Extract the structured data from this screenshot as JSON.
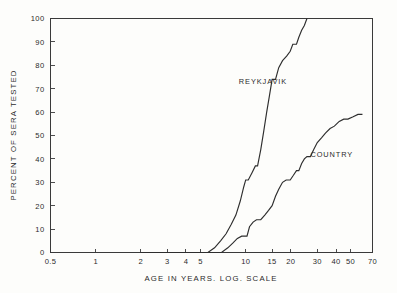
{
  "figure": {
    "background_color": "#fdfdfb",
    "line_color": "#2e2e2e",
    "axis_color": "#3a3a3a"
  },
  "chart_data": {
    "type": "line",
    "title": "",
    "subtitle": "",
    "xlabel": "AGE IN YEARS. LOG. SCALE",
    "ylabel": "PERCENT OF SERA TESTED",
    "xscale": "log",
    "yscale": "linear",
    "xlim": [
      0.5,
      70
    ],
    "ylim": [
      0,
      100
    ],
    "grid": false,
    "legend_position": "inline-annotation",
    "x_ticks": [
      0.5,
      1,
      2,
      3,
      4,
      5,
      10,
      15,
      20,
      30,
      40,
      50,
      70
    ],
    "x_tick_labels": [
      "0.5",
      "1",
      "2",
      "3",
      "4",
      "5",
      "10",
      "15",
      "20",
      "30",
      "40",
      "50",
      "70"
    ],
    "y_ticks": [
      0,
      10,
      20,
      30,
      40,
      50,
      60,
      70,
      80,
      90,
      100
    ],
    "y_tick_labels": [
      "0",
      "10",
      "20",
      "30",
      "40",
      "50",
      "60",
      "70",
      "80",
      "90",
      "100"
    ],
    "annotations": [
      {
        "text": "REYKJAVIK",
        "x": 9.0,
        "y": 72
      },
      {
        "text": "COUNTRY",
        "x": 27.0,
        "y": 41
      }
    ],
    "series": [
      {
        "name": "REYKJAVIK",
        "label": "REYKJAVIK",
        "points": [
          [
            2.0,
            0
          ],
          [
            3.0,
            0
          ],
          [
            4.0,
            0
          ],
          [
            5.0,
            0
          ],
          [
            5.6,
            0
          ],
          [
            6.2,
            2
          ],
          [
            6.8,
            5
          ],
          [
            7.4,
            8
          ],
          [
            8.0,
            12
          ],
          [
            8.6,
            16
          ],
          [
            9.2,
            22
          ],
          [
            9.7,
            28
          ],
          [
            10.0,
            31
          ],
          [
            10.4,
            31
          ],
          [
            11.0,
            34
          ],
          [
            11.6,
            37
          ],
          [
            12.0,
            37
          ],
          [
            12.6,
            44
          ],
          [
            13.2,
            52
          ],
          [
            13.8,
            60
          ],
          [
            14.4,
            67
          ],
          [
            15.0,
            74
          ],
          [
            15.8,
            74
          ],
          [
            16.6,
            79
          ],
          [
            17.6,
            82
          ],
          [
            18.8,
            84
          ],
          [
            19.8,
            86
          ],
          [
            20.6,
            89
          ],
          [
            21.8,
            89
          ],
          [
            22.6,
            92
          ],
          [
            23.6,
            95
          ],
          [
            24.6,
            97
          ],
          [
            25.6,
            100
          ]
        ]
      },
      {
        "name": "COUNTRY",
        "label": "COUNTRY",
        "points": [
          [
            2.0,
            0
          ],
          [
            3.0,
            0
          ],
          [
            4.0,
            0
          ],
          [
            5.0,
            0
          ],
          [
            6.0,
            0
          ],
          [
            6.9,
            0
          ],
          [
            7.6,
            2
          ],
          [
            8.2,
            4
          ],
          [
            8.8,
            6
          ],
          [
            9.4,
            7
          ],
          [
            10.2,
            7
          ],
          [
            10.6,
            11
          ],
          [
            11.2,
            13
          ],
          [
            11.8,
            14
          ],
          [
            12.6,
            14
          ],
          [
            13.4,
            16
          ],
          [
            14.2,
            18
          ],
          [
            15.0,
            20
          ],
          [
            15.8,
            24
          ],
          [
            16.6,
            27
          ],
          [
            17.6,
            30
          ],
          [
            18.6,
            31
          ],
          [
            19.8,
            31
          ],
          [
            20.8,
            33
          ],
          [
            21.8,
            35
          ],
          [
            22.6,
            35
          ],
          [
            23.6,
            38
          ],
          [
            24.6,
            40
          ],
          [
            25.6,
            41
          ],
          [
            27.0,
            41
          ],
          [
            28.4,
            44
          ],
          [
            30.0,
            47
          ],
          [
            32.0,
            49
          ],
          [
            34.0,
            51
          ],
          [
            36.5,
            53
          ],
          [
            39.0,
            54
          ],
          [
            42.0,
            56
          ],
          [
            45.0,
            57
          ],
          [
            48.0,
            57
          ],
          [
            52.0,
            58
          ],
          [
            56.0,
            59
          ],
          [
            60.0,
            59
          ]
        ]
      }
    ]
  }
}
